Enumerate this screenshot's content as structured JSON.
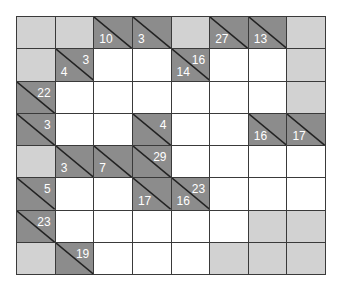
{
  "puzzle": {
    "type": "kakuro",
    "rows": 8,
    "cols": 8,
    "colors": {
      "clue": "#8c8c8c",
      "blocked": "#d2d2d2",
      "empty": "#ffffff",
      "grid_line": "#3a3a3a",
      "clue_text": "#ffffff"
    },
    "grid": [
      [
        {
          "t": "g"
        },
        {
          "t": "g"
        },
        {
          "t": "c",
          "down": "10"
        },
        {
          "t": "c",
          "down": "3"
        },
        {
          "t": "g"
        },
        {
          "t": "c",
          "down": "27"
        },
        {
          "t": "c",
          "down": "13"
        },
        {
          "t": "g"
        }
      ],
      [
        {
          "t": "g"
        },
        {
          "t": "c",
          "down": "4",
          "across": "3"
        },
        {
          "t": "w"
        },
        {
          "t": "w"
        },
        {
          "t": "c",
          "down": "14",
          "across": "16"
        },
        {
          "t": "w"
        },
        {
          "t": "w"
        },
        {
          "t": "g"
        }
      ],
      [
        {
          "t": "c",
          "across": "22"
        },
        {
          "t": "w"
        },
        {
          "t": "w"
        },
        {
          "t": "w"
        },
        {
          "t": "w"
        },
        {
          "t": "w"
        },
        {
          "t": "w"
        },
        {
          "t": "g"
        }
      ],
      [
        {
          "t": "c",
          "across": "3"
        },
        {
          "t": "w"
        },
        {
          "t": "w"
        },
        {
          "t": "c",
          "across": "4"
        },
        {
          "t": "w"
        },
        {
          "t": "w"
        },
        {
          "t": "c",
          "down": "16"
        },
        {
          "t": "c",
          "down": "17"
        }
      ],
      [
        {
          "t": "g"
        },
        {
          "t": "c",
          "down": "3"
        },
        {
          "t": "c",
          "down": "7"
        },
        {
          "t": "c",
          "across": "29"
        },
        {
          "t": "w"
        },
        {
          "t": "w"
        },
        {
          "t": "w"
        },
        {
          "t": "w"
        }
      ],
      [
        {
          "t": "c",
          "across": "5"
        },
        {
          "t": "w"
        },
        {
          "t": "w"
        },
        {
          "t": "c",
          "down": "17"
        },
        {
          "t": "c",
          "down": "16",
          "across": "23"
        },
        {
          "t": "w"
        },
        {
          "t": "w"
        },
        {
          "t": "w"
        }
      ],
      [
        {
          "t": "c",
          "across": "23"
        },
        {
          "t": "w"
        },
        {
          "t": "w"
        },
        {
          "t": "w"
        },
        {
          "t": "w"
        },
        {
          "t": "w"
        },
        {
          "t": "g"
        },
        {
          "t": "g"
        }
      ],
      [
        {
          "t": "g"
        },
        {
          "t": "c",
          "across": "19"
        },
        {
          "t": "w"
        },
        {
          "t": "w"
        },
        {
          "t": "w"
        },
        {
          "t": "g"
        },
        {
          "t": "g"
        },
        {
          "t": "g"
        }
      ]
    ]
  }
}
